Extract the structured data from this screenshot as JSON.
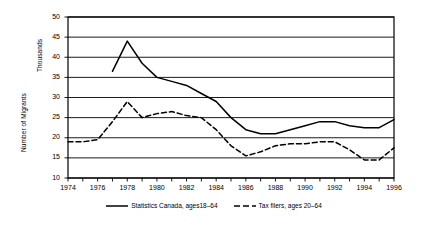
{
  "chart_data": {
    "type": "line",
    "title": "",
    "xlabel": "",
    "ylabel": "Number of Migrants",
    "ylabel_secondary": "Thousands",
    "xlim": [
      1974,
      1996
    ],
    "ylim": [
      10,
      50
    ],
    "ytick_step": 5,
    "xtick_step": 1,
    "xtick_label_step": 2,
    "grid": true,
    "legend_position": "bottom-center",
    "yticks": [
      50,
      45,
      40,
      35,
      30,
      25,
      20,
      15,
      10
    ],
    "xticks": [
      1974,
      1975,
      1976,
      1977,
      1978,
      1979,
      1980,
      1981,
      1982,
      1983,
      1984,
      1985,
      1986,
      1987,
      1988,
      1989,
      1990,
      1991,
      1992,
      1993,
      1994,
      1995,
      1996
    ],
    "xtick_labels": [
      "1974",
      "1976",
      "1978",
      "1980",
      "1982",
      "1984",
      "1986",
      "1988",
      "1990",
      "1992",
      "1994",
      "1996"
    ],
    "xtick_labels_years": [
      1974,
      1976,
      1978,
      1980,
      1982,
      1984,
      1986,
      1988,
      1990,
      1992,
      1994,
      1996
    ],
    "series": [
      {
        "name": "Statistics Canada, ages18–64",
        "style": "solid",
        "color": "#000000",
        "x": [
          1977,
          1978,
          1979,
          1980,
          1981,
          1982,
          1983,
          1984,
          1985,
          1986,
          1987,
          1988,
          1989,
          1990,
          1991,
          1992,
          1993,
          1994,
          1995,
          1996
        ],
        "values": [
          36.5,
          44.0,
          38.5,
          35.0,
          34.0,
          33.0,
          31.0,
          29.0,
          25.0,
          22.0,
          21.0,
          21.0,
          22.0,
          23.0,
          24.0,
          24.0,
          23.0,
          22.5,
          22.5,
          24.5
        ]
      },
      {
        "name": "Tax filers, ages 20–64",
        "style": "dashed",
        "color": "#000000",
        "x": [
          1974,
          1975,
          1976,
          1977,
          1978,
          1979,
          1980,
          1981,
          1982,
          1983,
          1984,
          1985,
          1986,
          1987,
          1988,
          1989,
          1990,
          1991,
          1992,
          1993,
          1994,
          1995,
          1996
        ],
        "values": [
          19.0,
          19.0,
          19.5,
          24.0,
          29.0,
          25.0,
          26.0,
          26.5,
          25.5,
          25.0,
          22.0,
          18.0,
          15.5,
          16.5,
          18.0,
          18.5,
          18.5,
          19.0,
          19.0,
          17.0,
          14.5,
          14.5,
          17.5
        ]
      }
    ]
  },
  "legend": {
    "entries": [
      {
        "label": "Statistics Canada, ages18–64"
      },
      {
        "label": "Tax filers, ages 20–64"
      }
    ]
  },
  "axes": {
    "y_title_primary": "Number of Migrants",
    "y_title_secondary": "Thousands"
  }
}
